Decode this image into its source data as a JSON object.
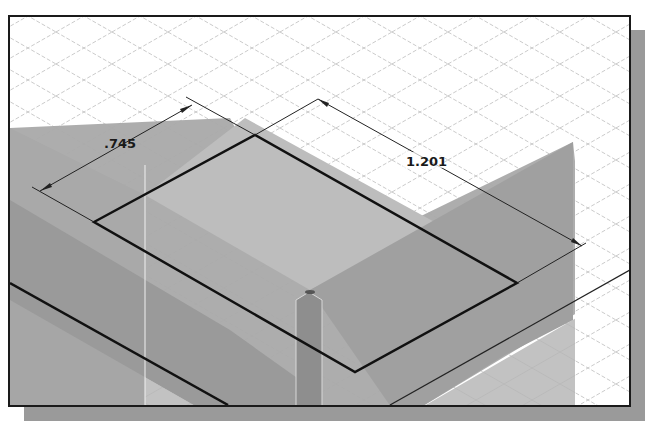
{
  "app": {
    "view_type": "isometric 3D sketch viewport"
  },
  "viewport": {
    "background": "#ffffff",
    "grid_color": "#b8b8b8",
    "plane_colors": {
      "horizontal_plane": "#a8a8a8",
      "front_plane": "#9c9c9c",
      "right_plane": "#a2a2a2",
      "lower_plane": "#c2c2c2",
      "vertical_strip": "#8e8e8e"
    },
    "sketch_line_color": "#111111"
  },
  "sketch": {
    "shape": "rectangle",
    "corners": {
      "left": [
        94,
        222
      ],
      "top": [
        255,
        135
      ],
      "right": [
        517,
        283
      ],
      "bottom": [
        355,
        372
      ]
    }
  },
  "dimensions": [
    {
      "id": "width",
      "label": ".745",
      "value": 0.745
    },
    {
      "id": "length",
      "label": "1.201",
      "value": 1.201
    }
  ]
}
